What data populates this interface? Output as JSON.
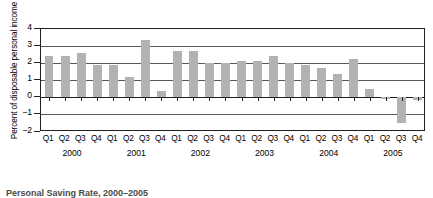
{
  "chart_data": {
    "type": "bar",
    "title": "",
    "xlabel": "",
    "ylabel": "Percent of disposable personal income",
    "ylim": [
      -2,
      4
    ],
    "yticks": [
      4,
      3,
      2,
      1,
      0,
      -1,
      -2
    ],
    "ytick_labels": [
      "4",
      "3",
      "2",
      "1",
      "0",
      "−1",
      "−2"
    ],
    "grid": true,
    "legend": "none",
    "bar_color": "#b2b2b2",
    "axis_color": "#231f20",
    "categories": [
      "Q1",
      "Q2",
      "Q3",
      "Q4",
      "Q1",
      "Q2",
      "Q3",
      "Q4",
      "Q1",
      "Q2",
      "Q3",
      "Q4",
      "Q1",
      "Q2",
      "Q3",
      "Q4",
      "Q1",
      "Q2",
      "Q3",
      "Q4",
      "Q1",
      "Q2",
      "Q3",
      "Q4"
    ],
    "values": [
      2.4,
      2.4,
      2.6,
      1.85,
      1.85,
      1.2,
      3.35,
      0.35,
      2.7,
      2.7,
      2.0,
      2.0,
      2.1,
      2.1,
      2.4,
      2.0,
      1.9,
      1.7,
      1.35,
      2.2,
      0.45,
      -0.1,
      -1.5,
      -0.15
    ],
    "year_groups": [
      {
        "label": "2000",
        "start": 0,
        "count": 4
      },
      {
        "label": "2001",
        "start": 4,
        "count": 4
      },
      {
        "label": "2002",
        "start": 8,
        "count": 4
      },
      {
        "label": "2003",
        "start": 12,
        "count": 4
      },
      {
        "label": "2004",
        "start": 16,
        "count": 4
      },
      {
        "label": "2005",
        "start": 20,
        "count": 4
      }
    ]
  },
  "caption": {
    "cut_off_text": "Personal Saving Rate, 2000–2005"
  }
}
